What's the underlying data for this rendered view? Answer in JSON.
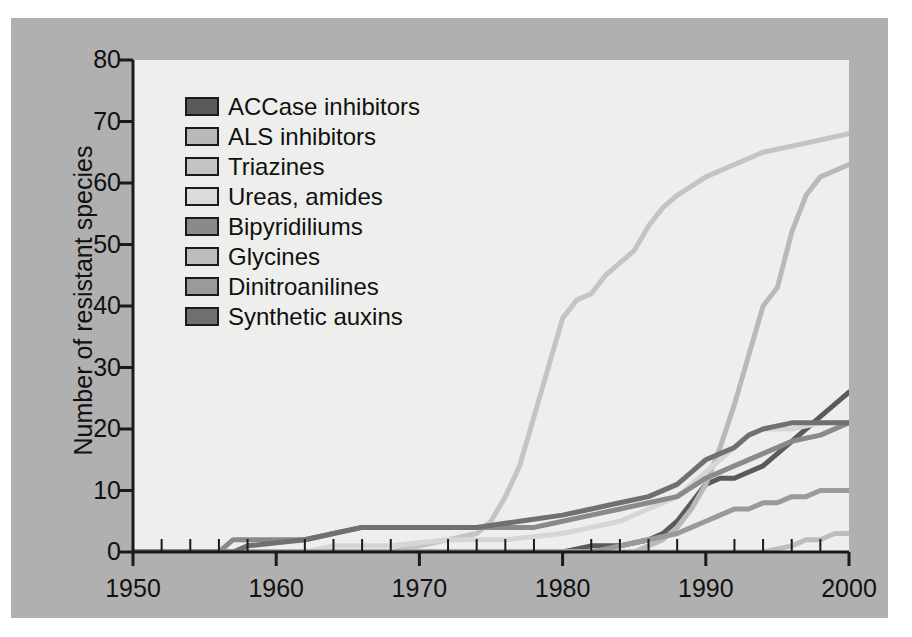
{
  "figure": {
    "background_color": "#b0b0b0",
    "panel_color": "#eeeeec",
    "axis_color": "#1a1a1a"
  },
  "chart_data": {
    "type": "line",
    "title": "",
    "xlabel": "",
    "ylabel": "Number of resistant species",
    "xlim": [
      1950,
      2000
    ],
    "ylim": [
      0,
      80
    ],
    "xticks": [
      1950,
      1960,
      1970,
      1980,
      1990,
      2000
    ],
    "xtick_labels": [
      "1950",
      "1960",
      "1970",
      "1980",
      "1990",
      "2000"
    ],
    "yticks": [
      0,
      10,
      20,
      30,
      40,
      50,
      60,
      70,
      80
    ],
    "ytick_labels": [
      "0",
      "10",
      "20",
      "30",
      "40",
      "50",
      "60",
      "70",
      "80"
    ],
    "minor_xtick_step": 2,
    "grid": false,
    "legend_position": "upper left",
    "series": [
      {
        "name": "ACCase inhibitors",
        "color": "#5a5a5a",
        "x": [
          1950,
          1980,
          1982,
          1984,
          1986,
          1987,
          1988,
          1989,
          1990,
          1991,
          1992,
          1993,
          1994,
          1995,
          1996,
          1997,
          1998,
          1999,
          2000
        ],
        "values": [
          0,
          0,
          1,
          1,
          2,
          3,
          5,
          8,
          11,
          12,
          12,
          13,
          14,
          16,
          18,
          20,
          22,
          24,
          26
        ]
      },
      {
        "name": "ALS inhibitors",
        "color": "#b9b9b9",
        "x": [
          1950,
          1985,
          1986,
          1987,
          1988,
          1989,
          1990,
          1991,
          1992,
          1993,
          1994,
          1995,
          1996,
          1997,
          1998,
          1999,
          2000
        ],
        "values": [
          0,
          0,
          1,
          2,
          4,
          7,
          11,
          17,
          24,
          32,
          40,
          43,
          52,
          58,
          61,
          62,
          63
        ]
      },
      {
        "name": "Triazines",
        "color": "#c4c4c4",
        "x": [
          1950,
          1968,
          1970,
          1972,
          1974,
          1975,
          1976,
          1977,
          1978,
          1979,
          1980,
          1981,
          1982,
          1983,
          1984,
          1985,
          1986,
          1987,
          1988,
          1990,
          1992,
          1994,
          1996,
          1998,
          2000
        ],
        "values": [
          0,
          0,
          1,
          2,
          3,
          5,
          9,
          14,
          22,
          30,
          38,
          41,
          42,
          45,
          47,
          49,
          53,
          56,
          58,
          61,
          63,
          65,
          66,
          67,
          68
        ]
      },
      {
        "name": "Ureas, amides",
        "color": "#d6d6d4",
        "x": [
          1950,
          1962,
          1964,
          1968,
          1972,
          1976,
          1980,
          1982,
          1984,
          1986,
          1988,
          1989,
          1990,
          1991,
          1992,
          1993,
          1994,
          1995,
          1996,
          1998,
          2000
        ],
        "values": [
          0,
          0,
          1,
          1,
          2,
          2,
          3,
          4,
          5,
          7,
          9,
          11,
          13,
          15,
          17,
          19,
          20,
          20,
          20,
          21,
          21
        ]
      },
      {
        "name": "Bipyridiliums",
        "color": "#8a8a8a",
        "x": [
          1950,
          1956,
          1957,
          1962,
          1964,
          1966,
          1970,
          1974,
          1976,
          1978,
          1980,
          1982,
          1984,
          1986,
          1988,
          1990,
          1992,
          1994,
          1996,
          1998,
          2000
        ],
        "values": [
          0,
          0,
          2,
          2,
          3,
          4,
          4,
          4,
          4,
          4,
          5,
          6,
          7,
          8,
          9,
          12,
          14,
          16,
          18,
          19,
          21
        ]
      },
      {
        "name": "Glycines",
        "color": "#bdbdbd",
        "x": [
          1950,
          1988,
          1990,
          1992,
          1994,
          1996,
          1997,
          1998,
          1999,
          2000
        ],
        "values": [
          0,
          0,
          0,
          0,
          0,
          1,
          2,
          2,
          3,
          3
        ]
      },
      {
        "name": "Dinitroanilines",
        "color": "#9a9a9a",
        "x": [
          1950,
          1982,
          1984,
          1986,
          1988,
          1989,
          1990,
          1991,
          1992,
          1993,
          1994,
          1995,
          1996,
          1997,
          1998,
          1999,
          2000
        ],
        "values": [
          0,
          0,
          1,
          2,
          3,
          4,
          5,
          6,
          7,
          7,
          8,
          8,
          9,
          9,
          10,
          10,
          10
        ]
      },
      {
        "name": "Synthetic auxins",
        "color": "#707070",
        "x": [
          1950,
          1957,
          1958,
          1962,
          1964,
          1966,
          1970,
          1974,
          1977,
          1980,
          1982,
          1984,
          1986,
          1988,
          1989,
          1990,
          1991,
          1992,
          1993,
          1994,
          1996,
          1998,
          2000
        ],
        "values": [
          0,
          0,
          1,
          2,
          3,
          4,
          4,
          4,
          5,
          6,
          7,
          8,
          9,
          11,
          13,
          15,
          16,
          17,
          19,
          20,
          21,
          21,
          21
        ]
      }
    ]
  },
  "legend": {
    "items": [
      {
        "label": "ACCase inhibitors",
        "color": "#5a5a5a"
      },
      {
        "label": "ALS inhibitors",
        "color": "#b9b9b9"
      },
      {
        "label": "Triazines",
        "color": "#c4c4c4"
      },
      {
        "label": "Ureas, amides",
        "color": "#dcdcda"
      },
      {
        "label": "Bipyridiliums",
        "color": "#8a8a8a"
      },
      {
        "label": "Glycines",
        "color": "#bdbdbd"
      },
      {
        "label": "Dinitroanilines",
        "color": "#9a9a9a"
      },
      {
        "label": "Synthetic auxins",
        "color": "#707070"
      }
    ]
  }
}
